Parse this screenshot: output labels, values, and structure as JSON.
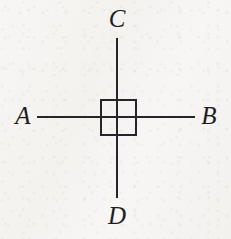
{
  "figure": {
    "width": 231,
    "height": 239,
    "background_color": "#f6f5f3",
    "ink_color": "#25252a"
  },
  "labels": {
    "left": "A",
    "right": "B",
    "top": "C",
    "bottom": "D"
  },
  "geometry": {
    "center_x": 117,
    "center_y": 117,
    "horizontal_line": {
      "x1": 37,
      "x2": 195,
      "y": 117,
      "thickness": 2
    },
    "vertical_line": {
      "y1": 38,
      "y2": 198,
      "x": 117,
      "thickness": 2
    },
    "square": {
      "x": 100,
      "y": 99,
      "size": 37,
      "stroke": 2
    }
  }
}
